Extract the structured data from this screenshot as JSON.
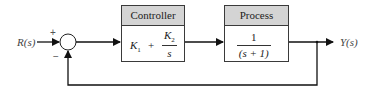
{
  "diagram": {
    "type": "feedback-control-block-diagram",
    "input_label": "R(s)",
    "output_label": "Y(s)",
    "summing_junction": {
      "plus_sign": "+",
      "minus_sign": "−"
    },
    "blocks": [
      {
        "title": "Controller",
        "transfer_function": {
          "k1": "K",
          "k1_sub": "1",
          "plus": "+",
          "num": "K",
          "num_sub": "2",
          "den": "s"
        }
      },
      {
        "title": "Process",
        "transfer_function": {
          "num": "1",
          "den": "(s + 1)"
        }
      }
    ],
    "feedback": "unity negative feedback"
  }
}
